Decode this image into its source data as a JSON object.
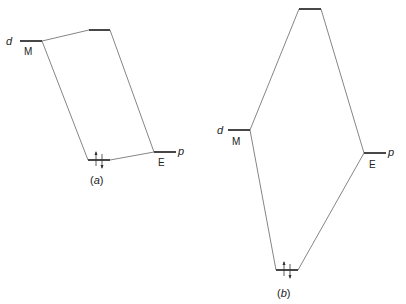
{
  "diagram": {
    "type": "molecular-orbital-energy-level-diagram",
    "panels": [
      {
        "id": "a",
        "caption": "(a)",
        "caption_letter": "a",
        "left_orbital": {
          "orbital": "d",
          "atom": "M"
        },
        "right_orbital": {
          "orbital": "p",
          "atom": "E"
        },
        "bonding_electrons": "↑↓",
        "levels": {
          "M": {
            "x1": 20,
            "x2": 42,
            "y": 41
          },
          "antibonding": {
            "x1": 89,
            "x2": 110,
            "y": 30
          },
          "E": {
            "x1": 154,
            "x2": 176,
            "y": 152
          },
          "bonding": {
            "x1": 88,
            "x2": 110,
            "y": 160
          }
        }
      },
      {
        "id": "b",
        "caption": "(b)",
        "caption_letter": "b",
        "left_orbital": {
          "orbital": "d",
          "atom": "M"
        },
        "right_orbital": {
          "orbital": "p",
          "atom": "E"
        },
        "bonding_electrons": "↑↓",
        "levels": {
          "M": {
            "x1": 220,
            "x2": 250,
            "y": 130
          },
          "antibonding": {
            "x1": 299,
            "x2": 321,
            "y": 9
          },
          "E": {
            "x1": 364,
            "x2": 386,
            "y": 153
          },
          "bonding": {
            "x1": 276,
            "x2": 298,
            "y": 270
          }
        }
      }
    ],
    "labels": {
      "d": "d",
      "p": "p",
      "M": "M",
      "E": "E",
      "paren_open": "(",
      "paren_close": ")"
    },
    "colors": {
      "level_line": "#333333",
      "connector_line": "#777777",
      "text": "#222222"
    }
  }
}
